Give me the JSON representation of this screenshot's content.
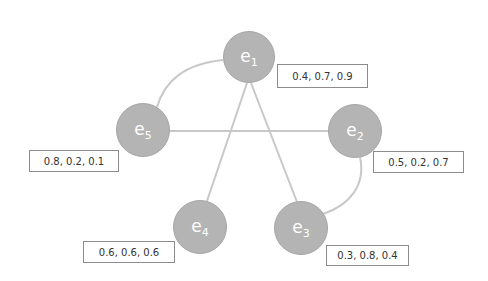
{
  "diagram": {
    "type": "graph",
    "node_color": "#b4b4b4",
    "edge_color": "#c8c8c8",
    "nodes": [
      {
        "id": "e1",
        "letter": "e",
        "index": "1",
        "cx": 249,
        "cy": 57,
        "r": 26,
        "values": "0.4, 0.7, 0.9",
        "box": {
          "x": 277,
          "y": 64,
          "w": 91,
          "h": 24
        }
      },
      {
        "id": "e2",
        "letter": "e",
        "index": "2",
        "cx": 355,
        "cy": 131,
        "r": 27,
        "values": "0.5, 0.2, 0.7",
        "box": {
          "x": 373,
          "y": 151,
          "w": 91,
          "h": 22
        }
      },
      {
        "id": "e3",
        "letter": "e",
        "index": "3",
        "cx": 301,
        "cy": 228,
        "r": 27,
        "values": "0.3, 0.8, 0.4",
        "box": {
          "x": 326,
          "y": 245,
          "w": 83,
          "h": 21
        }
      },
      {
        "id": "e4",
        "letter": "e",
        "index": "4",
        "cx": 200,
        "cy": 227,
        "r": 27,
        "values": "0.6, 0.6, 0.6",
        "box": {
          "x": 83,
          "y": 241,
          "w": 92,
          "h": 22
        }
      },
      {
        "id": "e5",
        "letter": "e",
        "index": "5",
        "cx": 143,
        "cy": 130,
        "r": 27,
        "values": "0.8, 0.2, 0.1",
        "box": {
          "x": 29,
          "y": 150,
          "w": 90,
          "h": 22
        }
      }
    ],
    "edges": [
      {
        "from": "e1",
        "to": "e5",
        "shape": "curve"
      },
      {
        "from": "e5",
        "to": "e2",
        "shape": "straight"
      },
      {
        "from": "e1",
        "to": "e4",
        "shape": "straight"
      },
      {
        "from": "e1",
        "to": "e3",
        "shape": "straight"
      },
      {
        "from": "e2",
        "to": "e3",
        "shape": "curve"
      }
    ]
  }
}
